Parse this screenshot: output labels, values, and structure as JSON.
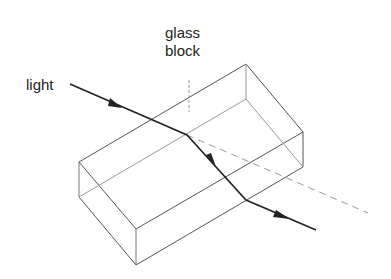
{
  "labels": {
    "light": "light",
    "glass_line1": "glass",
    "glass_line2": "block"
  },
  "colors": {
    "ray": "#222222",
    "edges": "#666666",
    "dashed": "#888888",
    "text": "#222222"
  }
}
